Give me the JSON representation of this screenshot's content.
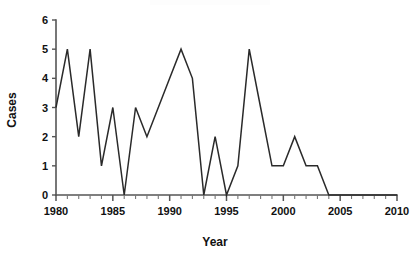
{
  "chart_data": {
    "type": "line",
    "title": "",
    "xlabel": "Year",
    "ylabel": "Cases",
    "x": [
      1980,
      1981,
      1982,
      1983,
      1984,
      1985,
      1986,
      1987,
      1988,
      1989,
      1990,
      1991,
      1992,
      1993,
      1994,
      1995,
      1996,
      1997,
      1998,
      1999,
      2000,
      2001,
      2002,
      2003,
      2004,
      2005,
      2006,
      2007,
      2008,
      2009,
      2010
    ],
    "values": [
      3,
      5,
      2,
      5,
      1,
      3,
      0,
      3,
      2,
      3,
      4,
      5,
      4,
      0,
      2,
      0,
      1,
      5,
      3,
      1,
      1,
      2,
      1,
      1,
      0,
      0,
      0,
      0,
      0,
      0,
      0
    ],
    "series": [
      {
        "name": "Cases",
        "values": [
          3,
          5,
          2,
          5,
          1,
          3,
          0,
          3,
          2,
          3,
          4,
          5,
          4,
          0,
          2,
          0,
          1,
          5,
          3,
          1,
          1,
          2,
          1,
          1,
          0,
          0,
          0,
          0,
          0,
          0,
          0
        ]
      }
    ],
    "xlim": [
      1980,
      2010
    ],
    "ylim": [
      0,
      6
    ],
    "xticks": [
      1980,
      1985,
      1990,
      1995,
      2000,
      2005,
      2010
    ],
    "xtick_labels": [
      "1980",
      "1985",
      "1990",
      "1995",
      "2000",
      "2005",
      "2010"
    ],
    "xtick_minor_step": 1,
    "yticks": [
      0,
      1,
      2,
      3,
      4,
      5,
      6
    ],
    "ytick_labels": [
      "0",
      "1",
      "2",
      "3",
      "4",
      "5",
      "6"
    ],
    "grid": false,
    "legend": false,
    "legend_position": "none",
    "line_color": "#2a2a2a",
    "axis_color": "#555555",
    "background_color": "#ffffff"
  },
  "axes": {
    "y_title": "Cases",
    "x_title": "Year"
  }
}
